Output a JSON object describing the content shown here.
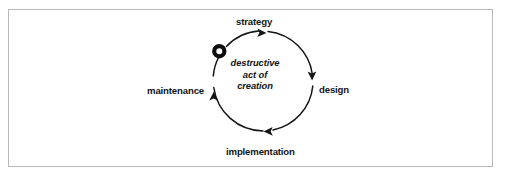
{
  "figure": {
    "background_color": "#ffffff",
    "frame_color": "#b9b9b9",
    "stroke_color": "#141414"
  },
  "cycle": {
    "direction": "clockwise",
    "center_note": {
      "lines": [
        "destructive",
        "act of",
        "creation"
      ],
      "style": "bold-italic"
    },
    "start_marker": {
      "icon": "ring-marker",
      "description": "thick black ring on the circle at upper-left"
    },
    "nodes": [
      {
        "id": "strategy",
        "label": "strategy",
        "position": "top"
      },
      {
        "id": "design",
        "label": "design",
        "position": "right"
      },
      {
        "id": "implementation",
        "label": "implementation",
        "position": "bottom"
      },
      {
        "id": "maintenance",
        "label": "maintenance",
        "position": "left"
      }
    ],
    "arrows": [
      {
        "id": "arrow-to-strategy",
        "points": "right",
        "at": "top"
      },
      {
        "id": "arrow-to-design",
        "points": "down",
        "at": "right"
      },
      {
        "id": "arrow-to-implementation",
        "points": "left",
        "at": "bottom"
      },
      {
        "id": "arrow-to-maintenance",
        "points": "up",
        "at": "left"
      }
    ]
  }
}
